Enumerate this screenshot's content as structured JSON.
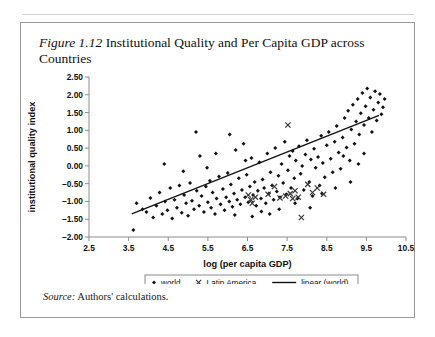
{
  "page": {
    "running_head": "",
    "source_label": "Source:",
    "source_text": "Authors' calculations."
  },
  "figure": {
    "number": "Figure 1.12",
    "caption": "Institutional Quality and Per Capita GDP across Countries"
  },
  "chart_data": {
    "type": "scatter",
    "title": "Institutional Quality and Per Capita GDP across Countries",
    "xlabel": "log (per capita GDP)",
    "ylabel": "institutional quality index",
    "xlim": [
      2.5,
      10.5
    ],
    "ylim": [
      -2.0,
      2.5
    ],
    "xticks": [
      "2.5",
      "3.5",
      "4.5",
      "5.5",
      "6.5",
      "7.5",
      "8.5",
      "9.5",
      "10.5"
    ],
    "yticks": [
      "2.50",
      "2.00",
      "1.50",
      "1.00",
      "0.50",
      "0.00",
      "-0.50",
      "-1.00",
      "-1.50",
      "-2.00"
    ],
    "grid": false,
    "legend_position": "bottom",
    "legend": [
      {
        "name": "world",
        "marker": "diamond",
        "color": "#111111"
      },
      {
        "name": "Latin America",
        "marker": "x",
        "color": "#333333"
      },
      {
        "name": "linear (world)",
        "marker": "line",
        "color": "#111111"
      }
    ],
    "series": [
      {
        "name": "world",
        "marker": "diamond",
        "points": [
          [
            3.62,
            -1.8
          ],
          [
            3.7,
            -1.05
          ],
          [
            3.85,
            -1.22
          ],
          [
            3.95,
            -1.3
          ],
          [
            4.05,
            -0.9
          ],
          [
            4.12,
            -1.45
          ],
          [
            4.2,
            -1.12
          ],
          [
            4.28,
            -0.75
          ],
          [
            4.35,
            -1.35
          ],
          [
            4.42,
            -1.0
          ],
          [
            4.48,
            -1.25
          ],
          [
            4.55,
            -0.62
          ],
          [
            4.6,
            -1.48
          ],
          [
            4.66,
            -0.95
          ],
          [
            4.72,
            -1.18
          ],
          [
            4.78,
            -0.55
          ],
          [
            4.84,
            -1.32
          ],
          [
            4.9,
            -0.82
          ],
          [
            4.95,
            -1.05
          ],
          [
            5.0,
            -1.4
          ],
          [
            5.05,
            -0.48
          ],
          [
            5.1,
            -0.98
          ],
          [
            5.15,
            -1.22
          ],
          [
            5.2,
            0.95
          ],
          [
            5.22,
            -0.7
          ],
          [
            5.28,
            -1.12
          ],
          [
            5.34,
            -0.85
          ],
          [
            5.4,
            -1.3
          ],
          [
            5.45,
            -0.58
          ],
          [
            5.5,
            -1.02
          ],
          [
            5.55,
            -0.42
          ],
          [
            5.58,
            -1.18
          ],
          [
            5.62,
            -0.75
          ],
          [
            5.68,
            -1.35
          ],
          [
            5.72,
            -0.92
          ],
          [
            5.78,
            -0.3
          ],
          [
            5.82,
            -1.08
          ],
          [
            5.88,
            -0.65
          ],
          [
            5.92,
            -1.25
          ],
          [
            5.96,
            -0.88
          ],
          [
            6.0,
            -0.2
          ],
          [
            6.04,
            -1.0
          ],
          [
            6.08,
            -0.52
          ],
          [
            6.12,
            -1.15
          ],
          [
            6.16,
            -0.78
          ],
          [
            6.2,
            0.45
          ],
          [
            6.24,
            -0.95
          ],
          [
            6.28,
            -0.35
          ],
          [
            6.32,
            -1.08
          ],
          [
            6.36,
            -0.68
          ],
          [
            6.4,
            0.62
          ],
          [
            6.44,
            -0.88
          ],
          [
            6.48,
            -0.25
          ],
          [
            6.52,
            -1.02
          ],
          [
            6.56,
            -0.58
          ],
          [
            6.6,
            0.22
          ],
          [
            6.64,
            -0.82
          ],
          [
            6.68,
            -0.45
          ],
          [
            6.72,
            -1.12
          ],
          [
            6.76,
            -0.7
          ],
          [
            6.8,
            0.1
          ],
          [
            6.84,
            -0.92
          ],
          [
            6.88,
            -0.38
          ],
          [
            6.92,
            -0.62
          ],
          [
            6.96,
            -1.05
          ],
          [
            7.0,
            0.35
          ],
          [
            7.04,
            -0.78
          ],
          [
            7.08,
            -0.18
          ],
          [
            7.12,
            -0.55
          ],
          [
            7.16,
            -0.95
          ],
          [
            7.2,
            0.5
          ],
          [
            7.24,
            -0.72
          ],
          [
            7.28,
            -0.28
          ],
          [
            7.32,
            -0.88
          ],
          [
            7.36,
            0.05
          ],
          [
            7.4,
            -0.48
          ],
          [
            7.44,
            0.68
          ],
          [
            7.48,
            -0.8
          ],
          [
            7.52,
            -0.12
          ],
          [
            7.56,
            0.28
          ],
          [
            7.6,
            -0.62
          ],
          [
            7.64,
            0.42
          ],
          [
            7.68,
            -0.35
          ],
          [
            7.72,
            0.15
          ],
          [
            7.76,
            -0.92
          ],
          [
            7.8,
            0.55
          ],
          [
            7.84,
            -0.22
          ],
          [
            7.88,
            0.0
          ],
          [
            7.92,
            -0.68
          ],
          [
            7.96,
            0.32
          ],
          [
            8.0,
            0.72
          ],
          [
            8.06,
            -0.45
          ],
          [
            8.1,
            0.18
          ],
          [
            8.14,
            -0.85
          ],
          [
            8.18,
            0.48
          ],
          [
            8.22,
            -0.05
          ],
          [
            8.28,
            0.25
          ],
          [
            8.32,
            -0.55
          ],
          [
            8.36,
            0.85
          ],
          [
            8.4,
            0.08
          ],
          [
            8.45,
            -0.32
          ],
          [
            8.5,
            0.58
          ],
          [
            8.55,
            0.95
          ],
          [
            8.6,
            0.2
          ],
          [
            8.65,
            -0.18
          ],
          [
            8.7,
            0.68
          ],
          [
            8.75,
            1.12
          ],
          [
            8.8,
            0.38
          ],
          [
            8.85,
            -0.08
          ],
          [
            8.9,
            0.8
          ],
          [
            8.95,
            1.35
          ],
          [
            9.0,
            0.52
          ],
          [
            9.04,
            1.55
          ],
          [
            9.08,
            0.15
          ],
          [
            9.12,
            1.02
          ],
          [
            9.16,
            1.72
          ],
          [
            9.2,
            0.62
          ],
          [
            9.24,
            1.25
          ],
          [
            9.28,
            1.88
          ],
          [
            9.32,
            0.88
          ],
          [
            9.36,
            1.48
          ],
          [
            9.4,
            2.05
          ],
          [
            9.44,
            1.15
          ],
          [
            9.48,
            1.68
          ],
          [
            9.52,
            2.18
          ],
          [
            9.56,
            1.35
          ],
          [
            9.6,
            1.92
          ],
          [
            9.64,
            0.95
          ],
          [
            9.68,
            1.58
          ],
          [
            9.72,
            2.1
          ],
          [
            9.76,
            1.28
          ],
          [
            9.8,
            1.78
          ],
          [
            9.84,
            2.02
          ],
          [
            9.88,
            1.45
          ],
          [
            9.92,
            1.65
          ],
          [
            9.96,
            1.88
          ],
          [
            5.3,
            0.28
          ],
          [
            5.7,
            0.35
          ],
          [
            6.05,
            0.88
          ],
          [
            6.45,
            0.15
          ],
          [
            6.85,
            -1.28
          ],
          [
            7.3,
            -1.22
          ],
          [
            7.7,
            -1.05
          ],
          [
            8.08,
            -1.18
          ],
          [
            8.38,
            -0.78
          ],
          [
            8.72,
            -0.62
          ],
          [
            9.1,
            -0.45
          ],
          [
            9.44,
            0.35
          ],
          [
            4.4,
            0.05
          ],
          [
            4.88,
            -0.15
          ],
          [
            5.48,
            -0.05
          ],
          [
            6.18,
            -1.38
          ],
          [
            6.62,
            -1.42
          ],
          [
            7.06,
            -1.35
          ],
          [
            8.92,
            0.28
          ],
          [
            9.3,
            0.05
          ]
        ]
      },
      {
        "name": "Latin America",
        "marker": "x",
        "points": [
          [
            6.52,
            -0.82
          ],
          [
            6.58,
            -0.95
          ],
          [
            6.62,
            -1.05
          ],
          [
            6.7,
            -0.88
          ],
          [
            7.02,
            -0.8
          ],
          [
            7.18,
            -0.58
          ],
          [
            7.32,
            -0.9
          ],
          [
            7.46,
            -0.85
          ],
          [
            7.52,
            1.15
          ],
          [
            7.58,
            -0.78
          ],
          [
            7.64,
            -0.92
          ],
          [
            7.7,
            -0.7
          ],
          [
            7.78,
            -0.88
          ],
          [
            7.86,
            -1.45
          ],
          [
            8.02,
            -0.52
          ],
          [
            8.14,
            -0.75
          ],
          [
            8.26,
            -0.62
          ],
          [
            8.42,
            -0.8
          ]
        ]
      }
    ],
    "trendline": {
      "name": "linear (world)",
      "x0": 3.58,
      "y0": -1.35,
      "x1": 9.82,
      "y1": 1.42
    }
  }
}
